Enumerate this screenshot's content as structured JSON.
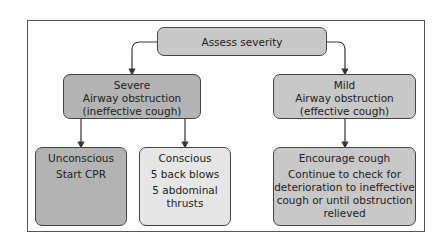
{
  "diagram": {
    "type": "flowchart",
    "root": {
      "label": "Assess severity"
    },
    "branches": [
      {
        "title": "Severe",
        "lines": [
          "Airway obstruction",
          "(ineffective cough)"
        ],
        "children": [
          {
            "title": "Unconscious",
            "lines": [
              "Start CPR"
            ]
          },
          {
            "title": "Conscious",
            "lines": [
              "5 back blows",
              "5 abdominal",
              "thrusts"
            ]
          }
        ]
      },
      {
        "title": "Mild",
        "lines": [
          "Airway obstruction",
          "(effective cough)"
        ],
        "children": [
          {
            "title": "Encourage cough",
            "lines": [
              "Continue to check for",
              "deterioration to ineffective",
              "cough or until obstruction",
              "relieved"
            ]
          }
        ]
      }
    ],
    "colors": {
      "dark_fill": "#b3b3b3",
      "mid_fill": "#c8c8c8",
      "light_fill": "#e6e6e6",
      "stroke": "#444444"
    }
  }
}
